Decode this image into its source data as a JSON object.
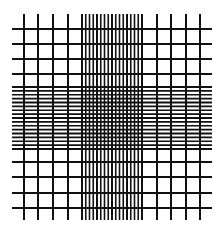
{
  "figure": {
    "line_color": "#111111",
    "background": "#ffffff",
    "extent": {
      "x_start": 12,
      "x_end": 212,
      "y_start": 14,
      "y_end": 220
    },
    "coarse_vertical_x": [
      24,
      38,
      53,
      68,
      157,
      171,
      186,
      200
    ],
    "coarse_horizontal_y": [
      29,
      44,
      59,
      74,
      162,
      177,
      193,
      208
    ],
    "vertical_band": {
      "x_start": 82,
      "x_end": 142,
      "lines": 17
    },
    "horizontal_band": {
      "y_start": 87,
      "y_end": 149,
      "lines": 17
    },
    "coarse_stroke": 2,
    "fine_stroke": 1.6
  }
}
